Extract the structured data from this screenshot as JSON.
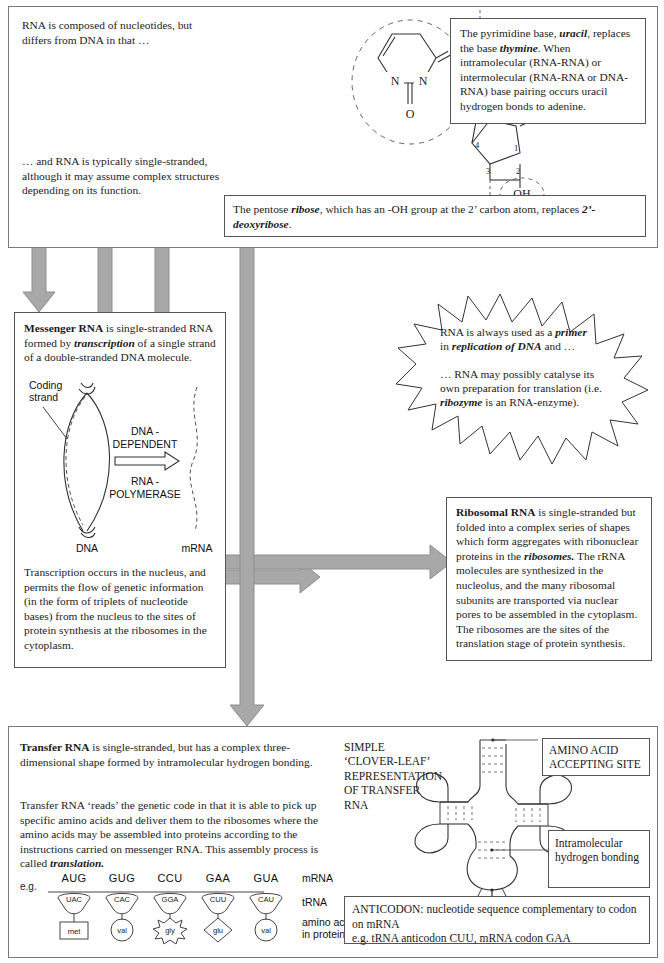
{
  "top_panel": {
    "intro_text_1": "RNA is composed of nucleotides, but differs from DNA in that …",
    "intro_text_2": "… and RNA is typically single-stranded, although it may assume complex structures depending on its function.",
    "uracil_box": {
      "line1_pre": "The pyrimidine base, ",
      "line1_bold": "uracil",
      "line1_post": ", replaces the base ",
      "line2_bold": "thymine",
      "line2_post": ".  When intramolecular (RNA-RNA) or intermolecular (RNA-RNA or DNA-RNA) base pairing occurs uracil hydrogen bonds to adenine."
    },
    "ribose_box": {
      "pre": "The pentose ",
      "bold1": "ribose",
      "mid": ", which has an -OH group at the 2’ carbon atom, replaces ",
      "bold2": "2’-deoxyribose",
      "post": "."
    },
    "structure_labels": {
      "phosphate": "P",
      "oxygen": "O",
      "ch2": "CH",
      "ch2_sub": "2",
      "c5": "5",
      "c4": "4",
      "c3": "3",
      "c2": "2",
      "c1": "1",
      "ring_oxygen": "O",
      "hydroxyl": "OH",
      "base_n1": "N",
      "base_n3": "N",
      "base_o2": "O",
      "base_o4": "O"
    }
  },
  "mrna_box": {
    "title": "Messenger RNA",
    "para1_post": " is single-stranded RNA formed by ",
    "para1_bold": "transcription",
    "para1_end": " of a single strand of a double-stranded DNA molecule.",
    "para2": "Transcription occurs in the nucleus, and permits the flow of genetic information (in the form of triplets of nucleotide bases) from the nucleus to the sites of protein synthesis at the ribosomes in the cytoplasm.",
    "diagram": {
      "coding_strand": "Coding strand",
      "enzyme_line1": "DNA -",
      "enzyme_line2": "DEPENDENT",
      "enzyme_line3": "RNA -",
      "enzyme_line4": "POLYMERASE",
      "dna_label": "DNA",
      "mrna_label": "mRNA"
    }
  },
  "starburst": {
    "para1_pre": "RNA is always used as a ",
    "para1_bold": "primer",
    "para1_mid": " in ",
    "para1_bold2": "replication of DNA",
    "para1_post": " and …",
    "para2_pre": "… RNA may possibly catalyse its own preparation for translation (i.e. ",
    "para2_bold": "ribozyme",
    "para2_post": " is an RNA-enzyme)."
  },
  "rrna_box": {
    "title": "Ribosomal RNA",
    "text_pre": " is single-stranded but folded into a complex series of shapes which form aggregates with ribonuclear proteins in the ",
    "text_bold": "ribosomes.",
    "text_post": "  The rRNA molecules are synthesized in the nucleolus, and the many ribosomal subunits are transported via nuclear pores to be assembled in the cytoplasm.  The ribosomes are the sites of the translation stage of protein synthesis."
  },
  "trna_panel": {
    "title": "Transfer RNA",
    "para1_post": " is single-stranded, but has a complex three-dimensional shape formed by intramolecular hydrogen bonding.",
    "para2_pre": "Transfer RNA ‘reads’ the genetic code in that it is able to pick up specific amino acids and deliver them to the ribosomes where the amino acids may be assembled into proteins according to the instructions carried on messenger RNA.  This assembly process is called ",
    "para2_bold": "translation.",
    "eg_label": "e.g.",
    "row_labels": {
      "mrna": "mRNA",
      "trna": "tRNA",
      "amino": "amino acids in protein"
    },
    "codons": [
      {
        "mrna": "AUG",
        "trna": "UAC",
        "amino": "met",
        "shape": "square"
      },
      {
        "mrna": "GUG",
        "trna": "CAC",
        "amino": "val",
        "shape": "circle"
      },
      {
        "mrna": "CCU",
        "trna": "GGA",
        "amino": "gly",
        "shape": "star"
      },
      {
        "mrna": "GAA",
        "trna": "CUU",
        "amino": "glu",
        "shape": "diamond"
      },
      {
        "mrna": "GUA",
        "trna": "CAU",
        "amino": "val",
        "shape": "circle"
      }
    ],
    "cloverleaf": {
      "caption": "SIMPLE ‘CLOVER-LEAF’ REPRESENTATION OF TRANSFER RNA",
      "amino_site_label": "AMINO ACID ACCEPTING SITE",
      "hbond_label": "Intramolecular hydrogen bonding",
      "anticodon_line1": "ANTICODON: nucleotide sequence complementary to codon on mRNA",
      "anticodon_line2": "e.g. tRNA anticodon CUU, mRNA codon GAA"
    }
  },
  "colors": {
    "arrow_gray": "#a8a8a8",
    "border": "#555555",
    "text": "#1c1c1c"
  }
}
